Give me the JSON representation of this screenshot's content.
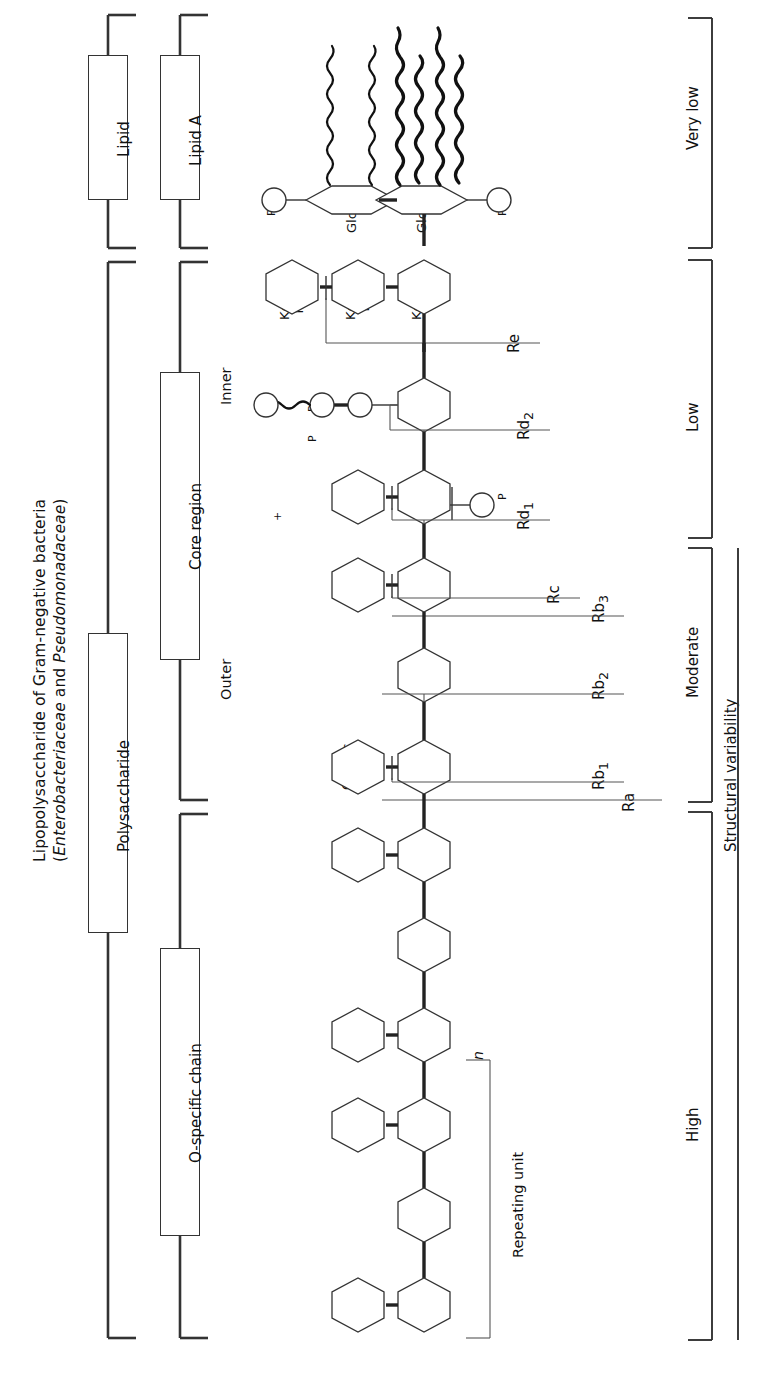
{
  "title": {
    "line1": "Lipopolysaccharide of Gram-negative bacteria",
    "line2_pre": "(",
    "line2_italic1": "Enterobacteriaceae",
    "line2_mid": " and ",
    "line2_italic2": "Pseudomonadaceae",
    "line2_post": ")"
  },
  "column1": {
    "lipid": "Lipid",
    "polysaccharide": "Polysaccharide"
  },
  "column2": {
    "lipid_a": "Lipid A",
    "core_region": "Core region",
    "o_specific_chain": "O-specific chain"
  },
  "core_sublabels": {
    "inner": "Inner",
    "outer": "Outer"
  },
  "repeating": {
    "label": "Repeating unit",
    "n": "n"
  },
  "variability": {
    "axis_label": "Structural variability",
    "levels": [
      {
        "name": "very-low",
        "label": "Very low"
      },
      {
        "name": "low",
        "label": "Low"
      },
      {
        "name": "moderate",
        "label": "Moderate"
      },
      {
        "name": "high",
        "label": "High"
      }
    ]
  },
  "chemotypes": [
    {
      "name": "Re",
      "label": "Re"
    },
    {
      "name": "Rd2",
      "label": "Rd",
      "sub": "2"
    },
    {
      "name": "Rd1",
      "label": "Rd",
      "sub": "1"
    },
    {
      "name": "Rc",
      "label": "Rc"
    },
    {
      "name": "Rb3",
      "label": "Rb",
      "sub": "3"
    },
    {
      "name": "Rb2",
      "label": "Rb",
      "sub": "2"
    },
    {
      "name": "Rb1",
      "label": "Rb",
      "sub": "1"
    },
    {
      "name": "Ra",
      "label": "Ra"
    }
  ],
  "sugars": {
    "glcn_a": {
      "name": "GlcN",
      "roman": ""
    },
    "glcn_b": {
      "name": "GlcN",
      "roman": ""
    },
    "kdo1": {
      "name": "Kdo",
      "roman": "I"
    },
    "kdo2": {
      "name": "Kdo",
      "roman": "II"
    },
    "kdo3": {
      "name": "Kdo",
      "roman": "III"
    },
    "hep1": {
      "name": "Hep",
      "roman": "I"
    },
    "hep2": {
      "name": "Hep",
      "roman": "II"
    },
    "hep3": {
      "name": "Hep",
      "roman": "III"
    },
    "glc1": {
      "name": "Glc",
      "roman": "I"
    },
    "gal1": {
      "name": "Gal",
      "roman": "I"
    },
    "gal2": {
      "name": "Gal",
      "roman": "II"
    },
    "glc2": {
      "name": "Glc",
      "roman": "II"
    },
    "glcnac": {
      "name": "GlcNAc",
      "roman": ""
    }
  },
  "groups": {
    "phosphate": "P",
    "cation": "+"
  },
  "colors": {
    "line": "#333333",
    "text": "#111111",
    "background": "#ffffff"
  }
}
